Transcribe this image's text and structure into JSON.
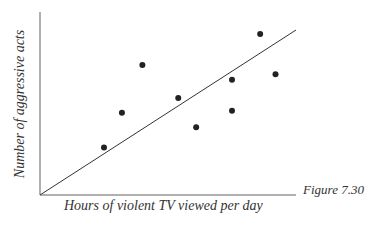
{
  "chart_data": {
    "type": "scatter",
    "title": "",
    "xlabel": "Hours of violent TV viewed per day",
    "ylabel": "Number of aggressive acts",
    "caption": "Figure 7.30",
    "ticks": "none",
    "grid": false,
    "legend": null,
    "xlim": [
      0,
      10
    ],
    "ylim": [
      0,
      10
    ],
    "points": [
      {
        "x": 2.5,
        "y": 2.6
      },
      {
        "x": 3.2,
        "y": 4.5
      },
      {
        "x": 4.0,
        "y": 7.1
      },
      {
        "x": 5.4,
        "y": 5.3
      },
      {
        "x": 6.1,
        "y": 3.7
      },
      {
        "x": 7.5,
        "y": 6.3
      },
      {
        "x": 7.5,
        "y": 4.6
      },
      {
        "x": 8.6,
        "y": 8.8
      },
      {
        "x": 9.2,
        "y": 6.6
      }
    ],
    "trend_line": {
      "x0": 0,
      "y0": 0,
      "x1": 10,
      "y1": 9.0
    },
    "colors": {
      "axes": "#aaaaaa",
      "points": "#222222",
      "line": "#333333"
    }
  }
}
